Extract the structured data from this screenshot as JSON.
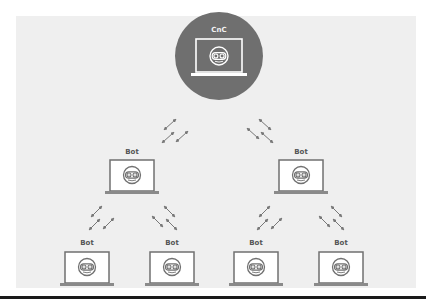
{
  "diagram": {
    "cnc": {
      "label": "CnC",
      "icon": "laptop-with-bot-face-icon"
    },
    "bots": [
      {
        "id": "mid-left",
        "label": "Bot",
        "icon": "laptop-with-bot-face-icon"
      },
      {
        "id": "mid-right",
        "label": "Bot",
        "icon": "laptop-with-bot-face-icon"
      },
      {
        "id": "bottom-1",
        "label": "Bot",
        "icon": "laptop-with-bot-face-icon"
      },
      {
        "id": "bottom-2",
        "label": "Bot",
        "icon": "laptop-with-bot-face-icon"
      },
      {
        "id": "bottom-3",
        "label": "Bot",
        "icon": "laptop-with-bot-face-icon"
      },
      {
        "id": "bottom-4",
        "label": "Bot",
        "icon": "laptop-with-bot-face-icon"
      }
    ],
    "connections": [
      {
        "from": "cnc",
        "to": "mid-left",
        "icon": "bidirectional-arrows-icon"
      },
      {
        "from": "cnc",
        "to": "mid-right",
        "icon": "bidirectional-arrows-icon"
      },
      {
        "from": "mid-left",
        "to": "bottom-1",
        "icon": "bidirectional-arrows-icon"
      },
      {
        "from": "mid-left",
        "to": "bottom-2",
        "icon": "bidirectional-arrows-icon"
      },
      {
        "from": "mid-right",
        "to": "bottom-3",
        "icon": "bidirectional-arrows-icon"
      },
      {
        "from": "mid-right",
        "to": "bottom-4",
        "icon": "bidirectional-arrows-icon"
      }
    ],
    "colors": {
      "panel": "#efefef",
      "cnc_circle": "#6f6f6f",
      "laptop_stroke": "#707070",
      "screen_fill": "#ffffff",
      "rule": "#1a1a1a"
    }
  }
}
